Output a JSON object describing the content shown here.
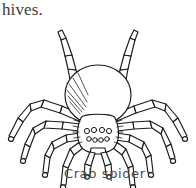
{
  "page": {
    "background_color": "#ffffff",
    "width": 196,
    "height": 188
  },
  "top_text": {
    "text": "hives.",
    "color": "#3b3b3b"
  },
  "caption": {
    "text": "Crab spider",
    "color": "#4a4a4a"
  },
  "illustration": {
    "subject": "crab-spider",
    "style": "black-and-white line drawing",
    "view": "dorsal top-down",
    "ink_color": "#1a1a1a",
    "fill_color": "#ffffff",
    "parts": {
      "abdomen": "large round oval at upper center with hatched shading on lower-left",
      "cephalothorax": "smaller shield shape below abdomen",
      "eyes": "two rows of small circles on front of cephalothorax",
      "pedipalps": "two short downward appendages below the head",
      "legs": "eight segmented legs, front pair raised upward, three pairs splayed sideways and down"
    },
    "leg_count": 8,
    "eye_count": 8
  }
}
